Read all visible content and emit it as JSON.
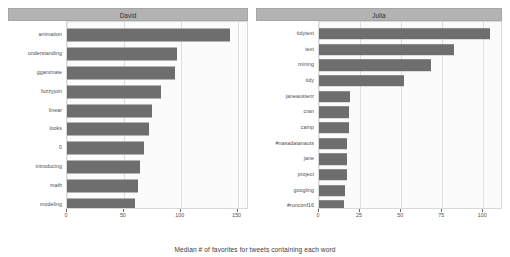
{
  "chart_data": {
    "type": "bar",
    "title": "",
    "subtitle": "",
    "xlabel": "Median # of favorites for tweets containing each word",
    "ylabel": "",
    "orientation": "horizontal",
    "grid": true,
    "legend": "none",
    "facets": [
      {
        "name": "David",
        "xlim": [
          0,
          160
        ],
        "xticks": [
          0,
          50,
          100,
          150
        ],
        "xtick_labels": [
          "0",
          "50",
          "100",
          "150"
        ],
        "categories": [
          "animation",
          "understanding",
          "gganimate",
          "fuzzyjoin",
          "linear",
          "looks",
          "0",
          "introducing",
          "math",
          "modeling"
        ],
        "values": [
          143,
          97,
          95,
          83,
          75,
          72,
          68,
          64,
          62,
          60
        ]
      },
      {
        "name": "Julia",
        "xlim": [
          0,
          112
        ],
        "xticks": [
          0,
          25,
          50,
          75,
          100
        ],
        "xtick_labels": [
          "0",
          "25",
          "50",
          "75",
          "100"
        ],
        "categories": [
          "tidytext",
          "text",
          "mining",
          "tidy",
          "janeaustenr",
          "cran",
          "camp",
          "#nasadatanauts",
          "jane",
          "project",
          "googling",
          "#runconf16"
        ],
        "values": [
          104,
          82,
          68,
          52,
          19,
          18,
          18,
          17,
          17,
          17,
          16,
          15
        ]
      }
    ]
  },
  "style": {
    "bar_color": "#6e6e6e",
    "strip_color": "#b3b3b3",
    "panel_color": "#fbfbfb",
    "grid_color": "#e8e8e8",
    "text_color": "#4d4d4d"
  }
}
